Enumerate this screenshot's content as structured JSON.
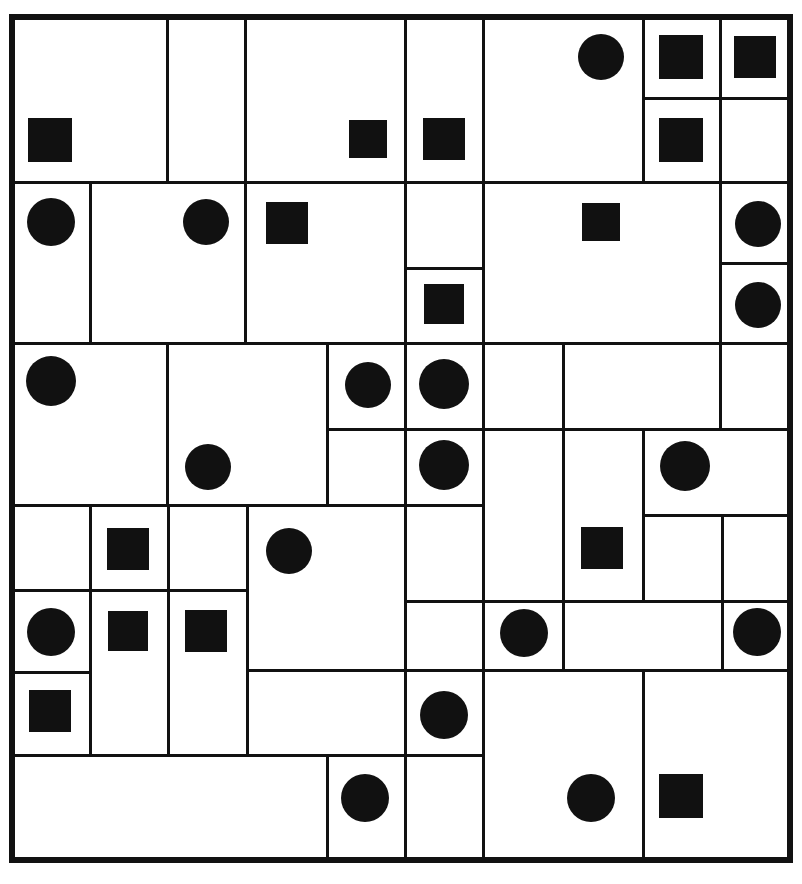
{
  "figure": {
    "kind": "puzzle-grid",
    "width": 802,
    "height": 884,
    "background_color": "#ffffff",
    "line_color": "#111111",
    "shape_color": "#111111",
    "outer_border_width": 6,
    "inner_line_width": 3,
    "board_bounds": {
      "x": 12,
      "y": 17,
      "width": 778,
      "height": 843
    },
    "counts": {
      "circles": 21,
      "squares": 17,
      "regions": 45
    }
  },
  "chart_data": {
    "type": "table",
    "xlabel": "",
    "ylabel": "",
    "grid": false,
    "legend": [
      "circle",
      "square"
    ],
    "regions": [
      {
        "id": "r1",
        "x": 12,
        "y": 17,
        "w": 155,
        "h": 165
      },
      {
        "id": "r2",
        "x": 167,
        "y": 17,
        "w": 78,
        "h": 165
      },
      {
        "id": "r3",
        "x": 245,
        "y": 17,
        "w": 160,
        "h": 165
      },
      {
        "id": "r4",
        "x": 405,
        "y": 17,
        "w": 78,
        "h": 165
      },
      {
        "id": "r5",
        "x": 483,
        "y": 17,
        "w": 160,
        "h": 165
      },
      {
        "id": "r6",
        "x": 643,
        "y": 17,
        "w": 77,
        "h": 81
      },
      {
        "id": "r7",
        "x": 720,
        "y": 17,
        "w": 70,
        "h": 81
      },
      {
        "id": "r8",
        "x": 643,
        "y": 98,
        "w": 77,
        "h": 84
      },
      {
        "id": "r9",
        "x": 720,
        "y": 98,
        "w": 70,
        "h": 84
      },
      {
        "id": "r10",
        "x": 12,
        "y": 182,
        "w": 78,
        "h": 161
      },
      {
        "id": "r11",
        "x": 90,
        "y": 182,
        "w": 155,
        "h": 161
      },
      {
        "id": "r12",
        "x": 245,
        "y": 182,
        "w": 160,
        "h": 161
      },
      {
        "id": "r13",
        "x": 405,
        "y": 182,
        "w": 78,
        "h": 86
      },
      {
        "id": "r14",
        "x": 405,
        "y": 268,
        "w": 78,
        "h": 75
      },
      {
        "id": "r15",
        "x": 483,
        "y": 182,
        "w": 237,
        "h": 161
      },
      {
        "id": "r16",
        "x": 720,
        "y": 182,
        "w": 70,
        "h": 81
      },
      {
        "id": "r17",
        "x": 720,
        "y": 263,
        "w": 70,
        "h": 80
      },
      {
        "id": "r18",
        "x": 12,
        "y": 343,
        "w": 155,
        "h": 162
      },
      {
        "id": "r19",
        "x": 167,
        "y": 343,
        "w": 160,
        "h": 162
      },
      {
        "id": "r20",
        "x": 327,
        "y": 343,
        "w": 78,
        "h": 86
      },
      {
        "id": "r21",
        "x": 405,
        "y": 343,
        "w": 78,
        "h": 86
      },
      {
        "id": "r22",
        "x": 405,
        "y": 429,
        "w": 78,
        "h": 76
      },
      {
        "id": "r23",
        "x": 483,
        "y": 343,
        "w": 80,
        "h": 86
      },
      {
        "id": "r24",
        "x": 563,
        "y": 343,
        "w": 157,
        "h": 86
      },
      {
        "id": "r25",
        "x": 720,
        "y": 343,
        "w": 70,
        "h": 86
      },
      {
        "id": "r26",
        "x": 483,
        "y": 429,
        "w": 80,
        "h": 172
      },
      {
        "id": "r27",
        "x": 563,
        "y": 429,
        "w": 80,
        "h": 172
      },
      {
        "id": "r28",
        "x": 643,
        "y": 429,
        "w": 147,
        "h": 86
      },
      {
        "id": "r29",
        "x": 12,
        "y": 505,
        "w": 78,
        "h": 85
      },
      {
        "id": "r30",
        "x": 90,
        "y": 505,
        "w": 78,
        "h": 85
      },
      {
        "id": "r31",
        "x": 168,
        "y": 505,
        "w": 79,
        "h": 85
      },
      {
        "id": "r32",
        "x": 247,
        "y": 505,
        "w": 158,
        "h": 165
      },
      {
        "id": "r33",
        "x": 643,
        "y": 515,
        "w": 79,
        "h": 86
      },
      {
        "id": "r34",
        "x": 722,
        "y": 515,
        "w": 68,
        "h": 86
      },
      {
        "id": "r35",
        "x": 12,
        "y": 590,
        "w": 78,
        "h": 82
      },
      {
        "id": "r36",
        "x": 90,
        "y": 590,
        "w": 78,
        "h": 165
      },
      {
        "id": "r37",
        "x": 168,
        "y": 590,
        "w": 79,
        "h": 165
      },
      {
        "id": "r38",
        "x": 405,
        "y": 601,
        "w": 78,
        "h": 69
      },
      {
        "id": "r39",
        "x": 483,
        "y": 601,
        "w": 80,
        "h": 69
      },
      {
        "id": "r40",
        "x": 563,
        "y": 601,
        "w": 159,
        "h": 69
      },
      {
        "id": "r41",
        "x": 722,
        "y": 601,
        "w": 68,
        "h": 69
      },
      {
        "id": "r42",
        "x": 12,
        "y": 672,
        "w": 78,
        "h": 83
      },
      {
        "id": "r43",
        "x": 247,
        "y": 670,
        "w": 158,
        "h": 85
      },
      {
        "id": "r44",
        "x": 405,
        "y": 670,
        "w": 78,
        "h": 85
      },
      {
        "id": "r45",
        "x": 483,
        "y": 670,
        "w": 160,
        "h": 190
      },
      {
        "id": "r46",
        "x": 643,
        "y": 670,
        "w": 147,
        "h": 190
      },
      {
        "id": "r47",
        "x": 12,
        "y": 755,
        "w": 315,
        "h": 105
      },
      {
        "id": "r48",
        "x": 327,
        "y": 755,
        "w": 78,
        "h": 105
      },
      {
        "id": "r49",
        "x": 405,
        "y": 755,
        "w": 78,
        "h": 105
      }
    ],
    "shapes": [
      {
        "kind": "square",
        "cx": 50,
        "cy": 140,
        "size": 44
      },
      {
        "kind": "square",
        "cx": 368,
        "cy": 139,
        "size": 38
      },
      {
        "kind": "square",
        "cx": 444,
        "cy": 139,
        "size": 42
      },
      {
        "kind": "circle",
        "cx": 601,
        "cy": 57,
        "r": 23
      },
      {
        "kind": "square",
        "cx": 681,
        "cy": 57,
        "size": 44
      },
      {
        "kind": "square",
        "cx": 755,
        "cy": 57,
        "size": 42
      },
      {
        "kind": "square",
        "cx": 681,
        "cy": 140,
        "size": 44
      },
      {
        "kind": "circle",
        "cx": 51,
        "cy": 222,
        "r": 24
      },
      {
        "kind": "circle",
        "cx": 206,
        "cy": 222,
        "r": 23
      },
      {
        "kind": "square",
        "cx": 287,
        "cy": 223,
        "size": 42
      },
      {
        "kind": "square",
        "cx": 601,
        "cy": 222,
        "size": 38
      },
      {
        "kind": "circle",
        "cx": 758,
        "cy": 224,
        "r": 23
      },
      {
        "kind": "square",
        "cx": 444,
        "cy": 304,
        "size": 40
      },
      {
        "kind": "circle",
        "cx": 758,
        "cy": 305,
        "r": 23
      },
      {
        "kind": "circle",
        "cx": 51,
        "cy": 381,
        "r": 25
      },
      {
        "kind": "circle",
        "cx": 368,
        "cy": 385,
        "r": 23
      },
      {
        "kind": "circle",
        "cx": 444,
        "cy": 384,
        "r": 25
      },
      {
        "kind": "circle",
        "cx": 208,
        "cy": 467,
        "r": 23
      },
      {
        "kind": "circle",
        "cx": 444,
        "cy": 465,
        "r": 25
      },
      {
        "kind": "circle",
        "cx": 685,
        "cy": 466,
        "r": 25
      },
      {
        "kind": "square",
        "cx": 128,
        "cy": 549,
        "size": 42
      },
      {
        "kind": "circle",
        "cx": 289,
        "cy": 551,
        "r": 23
      },
      {
        "kind": "square",
        "cx": 602,
        "cy": 548,
        "size": 42
      },
      {
        "kind": "circle",
        "cx": 51,
        "cy": 632,
        "r": 24
      },
      {
        "kind": "square",
        "cx": 128,
        "cy": 631,
        "size": 40
      },
      {
        "kind": "square",
        "cx": 206,
        "cy": 631,
        "size": 42
      },
      {
        "kind": "circle",
        "cx": 524,
        "cy": 633,
        "r": 24
      },
      {
        "kind": "circle",
        "cx": 757,
        "cy": 632,
        "r": 24
      },
      {
        "kind": "square",
        "cx": 50,
        "cy": 711,
        "size": 42
      },
      {
        "kind": "circle",
        "cx": 444,
        "cy": 715,
        "r": 24
      },
      {
        "kind": "circle",
        "cx": 365,
        "cy": 798,
        "r": 24
      },
      {
        "kind": "circle",
        "cx": 591,
        "cy": 798,
        "r": 24
      },
      {
        "kind": "square",
        "cx": 681,
        "cy": 796,
        "size": 44
      }
    ]
  }
}
